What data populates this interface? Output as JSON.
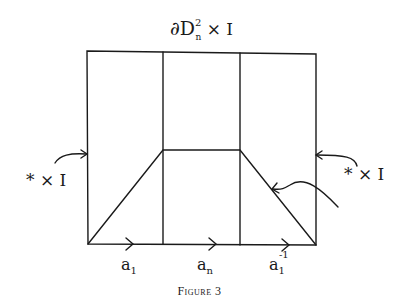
{
  "figure": {
    "caption": "Figure 3",
    "top_label": {
      "base": "∂D",
      "sup": "2",
      "sub": "n",
      "rest": " × I"
    },
    "left_label": "* × I",
    "right_label": "* × I",
    "bottom_labels": [
      {
        "base": "a",
        "sub": "1",
        "sup": ""
      },
      {
        "base": "a",
        "sub": "n",
        "sup": ""
      },
      {
        "base": "a",
        "sub": "1",
        "sup": "-1"
      }
    ]
  }
}
